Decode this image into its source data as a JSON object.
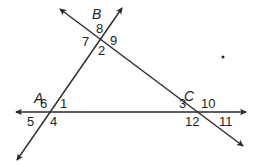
{
  "figure": {
    "line_color": "#2a2a2a",
    "points": [
      {
        "name": "A",
        "x": 34,
        "y": 103
      },
      {
        "name": "B",
        "x": 92,
        "y": 19
      },
      {
        "name": "C",
        "x": 184,
        "y": 101
      }
    ],
    "angles": [
      {
        "label": "1",
        "x": 60,
        "y": 108
      },
      {
        "label": "2",
        "x": 98,
        "y": 55
      },
      {
        "label": "3",
        "x": 179,
        "y": 108
      },
      {
        "label": "4",
        "x": 50,
        "y": 126
      },
      {
        "label": "5",
        "x": 27,
        "y": 126
      },
      {
        "label": "6",
        "x": 40,
        "y": 108
      },
      {
        "label": "7",
        "x": 82,
        "y": 46
      },
      {
        "label": "8",
        "x": 96,
        "y": 33
      },
      {
        "label": "9",
        "x": 110,
        "y": 45
      },
      {
        "label": "10",
        "x": 201,
        "y": 108
      },
      {
        "label": "11",
        "x": 219,
        "y": 126
      },
      {
        "label": "12",
        "x": 185,
        "y": 126
      }
    ],
    "lines": [
      {
        "name": "horizontal-line-AC",
        "x1": 246,
        "y1": 112,
        "x2": 16,
        "y2": 112,
        "arrows": "both"
      },
      {
        "name": "line-AB",
        "x1": 17,
        "y1": 160,
        "x2": 122,
        "y2": 8,
        "arrows": "both"
      },
      {
        "name": "line-BC",
        "x1": 60,
        "y1": 9,
        "x2": 243,
        "y2": 146,
        "arrows": "both"
      }
    ],
    "dot": {
      "x": 223,
      "y": 57
    }
  }
}
